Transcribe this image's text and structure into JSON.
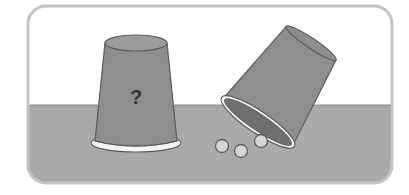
{
  "scene": {
    "description": "Two cups on a table; one upright hiding unknown contents, one tipped over spilling three marbles",
    "upright_cup": {
      "label": "?"
    },
    "tipped_cup": {
      "marbles_visible": 3
    },
    "colors": {
      "background": "#ffffff",
      "frame_border": "#bdbdbd",
      "wall": "#ffffff",
      "table": "#a9a9a9",
      "cup_body": "#8e8e8e",
      "cup_top": "#9a9a9a",
      "cup_inside": "#6f6f6f",
      "rim": "#f2f2f2",
      "outline": "#5c5c5c",
      "marble": "#d6d6d6"
    }
  }
}
